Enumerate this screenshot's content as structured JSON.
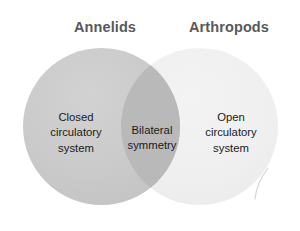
{
  "figure": {
    "type": "venn-diagram",
    "background_color": "#ffffff",
    "sets": [
      {
        "id": "annelids",
        "header": "Annelids",
        "fill_color": "#c9c9c9",
        "label_lines": [
          "Closed",
          "circulatory",
          "system"
        ],
        "label_text": "Closed circulatory system"
      },
      {
        "id": "arthropods",
        "header": "Arthropods",
        "fill_color": "#f0f0f0",
        "label_lines": [
          "Open",
          "circulatory",
          "system"
        ],
        "label_text": "Open circulatory system"
      }
    ],
    "intersection": {
      "id": "annelids-arthropods-overlap",
      "fill_color": "#b9b9b9",
      "label_lines": [
        "Bilateral",
        "symmetry"
      ],
      "label_text": "Bilateral symmetry"
    },
    "header_text_color": "#58595b",
    "body_text_color": "#1b1b1b"
  },
  "headers": {
    "left": "Annelids",
    "right": "Arthropods"
  },
  "left_region": {
    "line1": "Closed",
    "line2": "circulatory",
    "line3": "system"
  },
  "center_region": {
    "line1": "Bilateral",
    "line2": "symmetry"
  },
  "right_region": {
    "line1": "Open",
    "line2": "circulatory",
    "line3": "system"
  }
}
